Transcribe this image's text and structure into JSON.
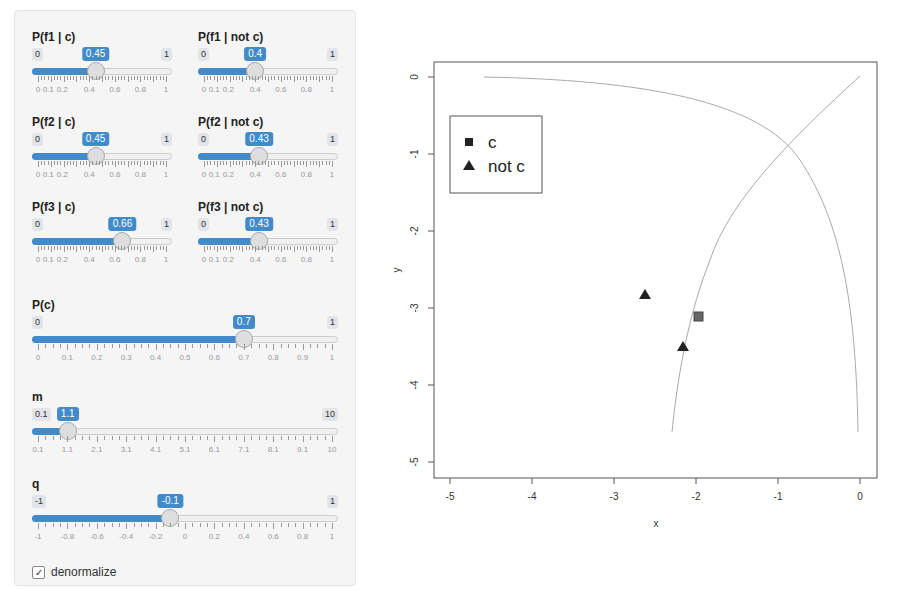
{
  "colors": {
    "accent": "#428bca",
    "panel_bg": "#f5f5f5"
  },
  "sliders": [
    {
      "id": "pf1c",
      "label": "P(f1 | c)",
      "min": 0,
      "max": 1,
      "value": 0.45,
      "min_label": "0",
      "max_label": "1",
      "value_label": "0.45",
      "tick_labels": [
        "0",
        "0.1",
        "0.2",
        "0.4",
        "0.6",
        "0.8",
        "1"
      ]
    },
    {
      "id": "pf1notc",
      "label": "P(f1 | not c)",
      "min": 0,
      "max": 1,
      "value": 0.4,
      "min_label": "0",
      "max_label": "1",
      "value_label": "0.4",
      "tick_labels": [
        "0",
        "0.1",
        "0.2",
        "0.4",
        "0.6",
        "0.8",
        "1"
      ]
    },
    {
      "id": "pf2c",
      "label": "P(f2 | c)",
      "min": 0,
      "max": 1,
      "value": 0.45,
      "min_label": "0",
      "max_label": "1",
      "value_label": "0.45",
      "tick_labels": [
        "0",
        "0.1",
        "0.2",
        "0.4",
        "0.6",
        "0.8",
        "1"
      ]
    },
    {
      "id": "pf2notc",
      "label": "P(f2 | not c)",
      "min": 0,
      "max": 1,
      "value": 0.43,
      "min_label": "0",
      "max_label": "1",
      "value_label": "0.43",
      "tick_labels": [
        "0",
        "0.1",
        "0.2",
        "0.4",
        "0.6",
        "0.8",
        "1"
      ]
    },
    {
      "id": "pf3c",
      "label": "P(f3 | c)",
      "min": 0,
      "max": 1,
      "value": 0.66,
      "min_label": "0",
      "max_label": "1",
      "value_label": "0.66",
      "tick_labels": [
        "0",
        "0.1",
        "0.2",
        "0.4",
        "0.6",
        "0.8",
        "1"
      ]
    },
    {
      "id": "pf3notc",
      "label": "P(f3 | not c)",
      "min": 0,
      "max": 1,
      "value": 0.43,
      "min_label": "0",
      "max_label": "1",
      "value_label": "0.43",
      "tick_labels": [
        "0",
        "0.1",
        "0.2",
        "0.4",
        "0.6",
        "0.8",
        "1"
      ]
    },
    {
      "id": "pc",
      "label": "P(c)",
      "min": 0,
      "max": 1,
      "value": 0.7,
      "min_label": "0",
      "max_label": "1",
      "value_label": "0.7",
      "tick_labels": [
        "0",
        "0.1",
        "0.2",
        "0.3",
        "0.4",
        "0.5",
        "0.6",
        "0.7",
        "0.8",
        "0.9",
        "1"
      ]
    },
    {
      "id": "m",
      "label": "m",
      "min": 0.1,
      "max": 10,
      "value": 1.1,
      "min_label": "0.1",
      "max_label": "10",
      "value_label": "1.1",
      "tick_labels": [
        "0.1",
        "1.1",
        "2.1",
        "3.1",
        "4.1",
        "5.1",
        "6.1",
        "7.1",
        "8.1",
        "9.1",
        "10"
      ]
    },
    {
      "id": "q",
      "label": "q",
      "min": -1,
      "max": 1,
      "value": -0.1,
      "min_label": "-1",
      "max_label": "1",
      "value_label": "-0.1",
      "tick_labels": [
        "-1",
        "-0.8",
        "-0.6",
        "-0.4",
        "-0.2",
        "0",
        "0.2",
        "0.4",
        "0.6",
        "0.8",
        "1"
      ]
    }
  ],
  "checkbox": {
    "label": "denormalize",
    "checked": true,
    "check_glyph": "✓"
  },
  "chart_data": {
    "type": "scatter",
    "title": "",
    "xlabel": "x",
    "ylabel": "y",
    "xlim": [
      -5.2,
      0.2
    ],
    "ylim": [
      -5.2,
      0.2
    ],
    "x_ticks": [
      "-5",
      "-4",
      "-3",
      "-2",
      "-1",
      "0"
    ],
    "y_ticks": [
      "0",
      "-1",
      "-2",
      "-3",
      "-4",
      "-5"
    ],
    "grid": false,
    "legend": {
      "position": "top-left",
      "entries": [
        {
          "label": "c",
          "marker": "square"
        },
        {
          "label": "not c",
          "marker": "triangle"
        }
      ]
    },
    "series": [
      {
        "name": "c",
        "marker": "square",
        "points": [
          {
            "x": -1.98,
            "y": -3.1
          }
        ]
      },
      {
        "name": "not c",
        "marker": "triangle",
        "points": [
          {
            "x": -2.65,
            "y": -2.82
          },
          {
            "x": -2.17,
            "y": -3.5
          }
        ]
      }
    ],
    "lines": [
      {
        "name": "decision-curve-1",
        "description": "from (-4.6,0) curving to (-0.02,-4.6)"
      },
      {
        "name": "decision-curve-2",
        "description": "from (0,0) curving to (-2.3,-4.55)"
      }
    ]
  }
}
